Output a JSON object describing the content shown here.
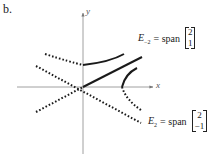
{
  "panel_label": "b.",
  "axes": {
    "x_label": "x",
    "y_label": "y"
  },
  "eigenspaces": [
    {
      "name_base": "E",
      "subscript": "−2",
      "equals": "= span",
      "vector": [
        "2",
        "1"
      ],
      "style": "solid",
      "flow": "toward origin"
    },
    {
      "name_base": "E",
      "subscript": "2",
      "equals": "= span",
      "vector": [
        "2",
        "−1"
      ],
      "style": "dotted",
      "flow": "away from origin"
    }
  ],
  "colors": {
    "ink": "#1a1a1a",
    "axis": "#777777",
    "background": "#ffffff"
  }
}
